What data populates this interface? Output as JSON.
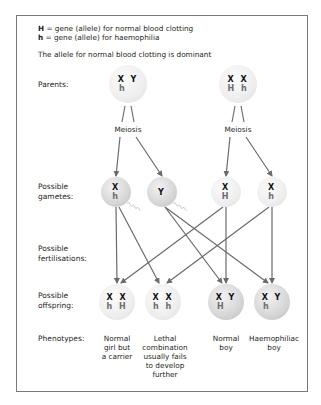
{
  "key": {
    "line1_symbol": "H",
    "line1_text": " = gene (allele) for normal blood clotting",
    "line2_symbol": "h",
    "line2_text": " = gene (allele) for haemophilia",
    "dominance_note": "The allele for normal blood clotting is dominant"
  },
  "row_labels": {
    "parents": "Parents:",
    "gametes": "Possible\ngametes:",
    "fertilisations": "Possible\nfertilisations:",
    "offspring": "Possible\noffspring:",
    "phenotypes": "Phenotypes:"
  },
  "meiosis_label": "Meiosis",
  "parents": [
    {
      "sex": "male",
      "chromosomes": "X Y",
      "alleles": "h  "
    },
    {
      "sex": "female",
      "chromosomes": "X X",
      "alleles": "H h"
    }
  ],
  "gametes": [
    {
      "source": "male",
      "chromosomes": "X",
      "alleles": "h"
    },
    {
      "source": "male",
      "chromosomes": "Y",
      "alleles": ""
    },
    {
      "source": "female",
      "chromosomes": "X",
      "alleles": "H"
    },
    {
      "source": "female",
      "chromosomes": "X",
      "alleles": "h"
    }
  ],
  "offspring": [
    {
      "chromosomes": "X X",
      "alleles": "h H",
      "phenotype": "Normal\ngirl but\na carrier"
    },
    {
      "chromosomes": "X X",
      "alleles": "h h",
      "phenotype": "Lethal\ncombination\nusually fails\nto develop\nfurther"
    },
    {
      "chromosomes": "X Y",
      "alleles": "H  ",
      "phenotype": "Normal\nboy"
    },
    {
      "chromosomes": "X Y",
      "alleles": "h  ",
      "phenotype": "Haemophiliac\nboy"
    }
  ],
  "fertilisations": [
    {
      "gamete": 0,
      "offspring": 0
    },
    {
      "gamete": 0,
      "offspring": 1
    },
    {
      "gamete": 1,
      "offspring": 2
    },
    {
      "gamete": 1,
      "offspring": 3
    },
    {
      "gamete": 2,
      "offspring": 0
    },
    {
      "gamete": 2,
      "offspring": 2
    },
    {
      "gamete": 3,
      "offspring": 1
    },
    {
      "gamete": 3,
      "offspring": 3
    }
  ],
  "colors": {
    "frame": "#7a7a7a",
    "arrow": "#6b6b6b",
    "allele_text": "#6d6d6d"
  }
}
